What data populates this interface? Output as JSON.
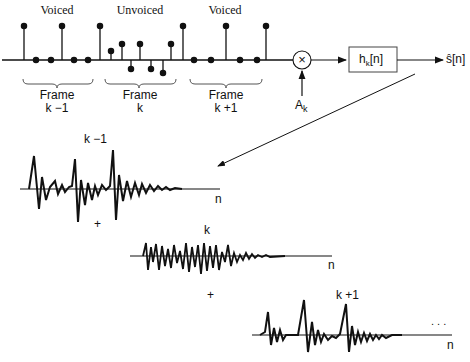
{
  "top": {
    "segment_labels": [
      "Voiced",
      "Unvoiced",
      "Voiced"
    ],
    "frame_labels": [
      {
        "line1": "Frame",
        "line2": "k −1"
      },
      {
        "line1": "Frame",
        "line2": "k"
      },
      {
        "line1": "Frame",
        "line2": "k +1"
      }
    ],
    "multiplier_symbol": "×",
    "gain_label": "A",
    "gain_sub": "k",
    "filter_label": "h",
    "filter_sub": "k",
    "filter_suffix": "[n]",
    "output_label": "ŝ[n]"
  },
  "bottom": {
    "responses": [
      {
        "title": "k −1",
        "axis": "n"
      },
      {
        "title": "k",
        "axis": "n"
      },
      {
        "title": "k +1",
        "axis": "n"
      }
    ],
    "plus": [
      "+",
      "+"
    ],
    "ellipsis": ". . ."
  }
}
